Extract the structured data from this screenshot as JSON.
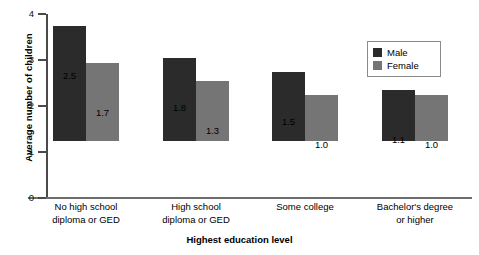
{
  "chart_data": {
    "type": "bar",
    "title": "",
    "xlabel": "Highest education level",
    "ylabel": "Average number of children",
    "categories": [
      "No high school\ndiploma or GED",
      "High school\ndiploma or GED",
      "Some college",
      "Bachelor's degree\nor higher"
    ],
    "category_lines": [
      [
        "No high school",
        "diploma or GED"
      ],
      [
        "High school",
        "diploma or GED"
      ],
      [
        "Some college",
        ""
      ],
      [
        "Bachelor's degree",
        "or higher"
      ]
    ],
    "series": [
      {
        "name": "Male",
        "color": "#2b2b2b",
        "values": [
          2.5,
          1.8,
          1.5,
          1.1
        ],
        "labels": [
          "2.5",
          "1.8",
          "1.5",
          "1.1"
        ]
      },
      {
        "name": "Female",
        "color": "#757575",
        "values": [
          1.7,
          1.3,
          1.0,
          1.0
        ],
        "labels": [
          "1.7",
          "1.3",
          "1.0",
          "1.0"
        ]
      }
    ],
    "ylim": [
      0,
      4
    ],
    "yticks": [
      0,
      1,
      2,
      3,
      4
    ],
    "ytick_labels": [
      "0",
      "1",
      "2",
      "3",
      "4"
    ],
    "grid": false,
    "legend_position": "top-right"
  },
  "legend": {
    "entries": [
      {
        "label": "Male",
        "color": "#2b2b2b"
      },
      {
        "label": "Female",
        "color": "#757575"
      }
    ]
  },
  "axis": {
    "y_title": "Average number of children",
    "x_title": "Highest education level"
  }
}
